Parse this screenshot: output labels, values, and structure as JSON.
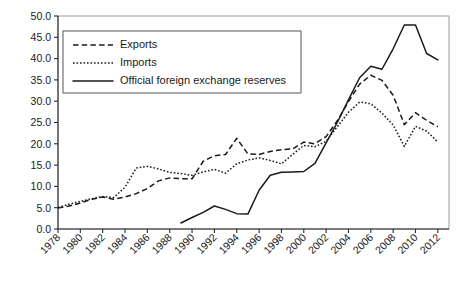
{
  "chart_data": {
    "type": "line",
    "title": "",
    "subtitle": "",
    "xlabel": "",
    "ylabel": "",
    "xlim": [
      1978,
      2013
    ],
    "ylim": [
      0.0,
      50.0
    ],
    "grid": false,
    "legend_position": "top-left",
    "x": [
      1978,
      1979,
      1980,
      1981,
      1982,
      1983,
      1984,
      1985,
      1986,
      1987,
      1988,
      1989,
      1990,
      1991,
      1992,
      1993,
      1994,
      1995,
      1996,
      1997,
      1998,
      1999,
      2000,
      2001,
      2002,
      2003,
      2004,
      2005,
      2006,
      2007,
      2008,
      2009,
      2010,
      2011,
      2012
    ],
    "ytick_labels": [
      "0.0",
      "5.0",
      "10.0",
      "15.0",
      "20.0",
      "25.0",
      "30.0",
      "35.0",
      "40.0",
      "45.0",
      "50.0"
    ],
    "ytick_values": [
      0.0,
      5.0,
      10.0,
      15.0,
      20.0,
      25.0,
      30.0,
      35.0,
      40.0,
      45.0,
      50.0
    ],
    "xtick_labels": [
      "1978",
      "1980",
      "1982",
      "1984",
      "1986",
      "1988",
      "1990",
      "1992",
      "1994",
      "1996",
      "1998",
      "2000",
      "2002",
      "2004",
      "2006",
      "2008",
      "2010",
      "2012"
    ],
    "xtick_values": [
      1978,
      1980,
      1982,
      1984,
      1986,
      1988,
      1990,
      1992,
      1994,
      1996,
      1998,
      2000,
      2002,
      2004,
      2006,
      2008,
      2010,
      2012
    ],
    "series": [
      {
        "name": "Exports",
        "style": "dashed",
        "color": "#1a1a1a",
        "x": [
          1978,
          1979,
          1980,
          1981,
          1982,
          1983,
          1984,
          1985,
          1986,
          1987,
          1988,
          1989,
          1990,
          1991,
          1992,
          1993,
          1994,
          1995,
          1996,
          1997,
          1998,
          1999,
          2000,
          2001,
          2002,
          2003,
          2004,
          2005,
          2006,
          2007,
          2008,
          2009,
          2010,
          2011,
          2012
        ],
        "values": [
          4.9,
          5.4,
          6.1,
          7.0,
          7.5,
          7.0,
          7.5,
          8.3,
          9.5,
          11.3,
          12.0,
          11.8,
          11.8,
          15.9,
          17.2,
          17.5,
          21.3,
          17.6,
          17.5,
          18.2,
          18.6,
          18.8,
          20.4,
          20.0,
          21.7,
          25.4,
          29.9,
          34.0,
          36.1,
          34.9,
          31.4,
          24.5,
          27.3,
          25.5,
          24.0
        ],
        "peak": {
          "x": 2006,
          "y": 36.1
        },
        "min": {
          "x": 1978,
          "y": 4.9
        }
      },
      {
        "name": "Imports",
        "style": "dotted",
        "color": "#1a1a1a",
        "x": [
          1978,
          1979,
          1980,
          1981,
          1982,
          1983,
          1984,
          1985,
          1986,
          1987,
          1988,
          1989,
          1990,
          1991,
          1992,
          1993,
          1994,
          1995,
          1996,
          1997,
          1998,
          1999,
          2000,
          2001,
          2002,
          2003,
          2004,
          2005,
          2006,
          2007,
          2008,
          2009,
          2010,
          2011,
          2012
        ],
        "values": [
          5.1,
          5.8,
          6.5,
          7.1,
          7.6,
          7.4,
          9.8,
          14.3,
          14.7,
          14.1,
          13.3,
          13.0,
          12.6,
          13.4,
          14.0,
          13.1,
          15.3,
          16.2,
          16.7,
          16.1,
          15.3,
          17.5,
          19.6,
          19.3,
          20.6,
          24.0,
          27.4,
          29.8,
          29.4,
          27.2,
          24.4,
          19.4,
          24.1,
          23.0,
          20.4
        ],
        "peak": {
          "x": 2005,
          "y": 29.8
        },
        "min": {
          "x": 1978,
          "y": 5.1
        }
      },
      {
        "name": "Official foreign exchange reserves",
        "style": "solid",
        "color": "#1a1a1a",
        "x": [
          1989,
          1990,
          1991,
          1992,
          1993,
          1994,
          1995,
          1996,
          1997,
          1998,
          1999,
          2000,
          2001,
          2002,
          2003,
          2004,
          2005,
          2006,
          2007,
          2008,
          2009,
          2010,
          2011,
          2012
        ],
        "values": [
          1.4,
          2.7,
          3.9,
          5.4,
          4.6,
          3.6,
          3.5,
          9.1,
          12.6,
          13.3,
          13.4,
          13.5,
          15.4,
          20.2,
          25.0,
          30.3,
          35.5,
          38.2,
          37.5,
          42.3,
          47.9,
          47.9,
          41.2,
          39.7
        ],
        "peak": {
          "x": 2009,
          "y": 47.9
        },
        "min": {
          "x": 1989,
          "y": 1.4
        }
      }
    ]
  },
  "legend": {
    "entries": [
      {
        "label": "Exports",
        "style": "dashed"
      },
      {
        "label": "Imports",
        "style": "dotted"
      },
      {
        "label": "Official foreign exchange reserves",
        "style": "solid"
      }
    ]
  },
  "colors": {
    "line": "#1a1a1a",
    "axis": "#2b2b2b",
    "frame": "#9a9a9a",
    "background": "#ffffff",
    "legend_border": "#555555"
  }
}
